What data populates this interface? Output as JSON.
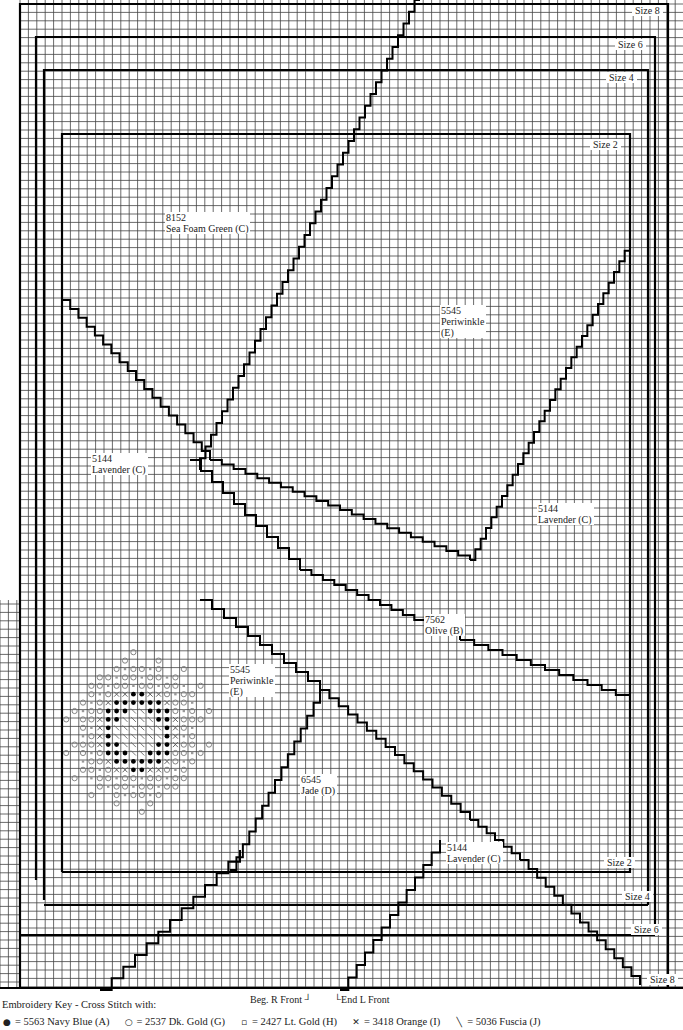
{
  "chart": {
    "type": "cross-stitch knitting chart",
    "grid": {
      "cell_px": 8.4,
      "line_color": "#222222",
      "outline_color": "#000000",
      "background": "#ffffff"
    }
  },
  "size_labels": [
    {
      "id": "size8_top",
      "text": "Size 8"
    },
    {
      "id": "size6_top",
      "text": "Size 6"
    },
    {
      "id": "size4_top",
      "text": "Size 4"
    },
    {
      "id": "size2_top",
      "text": "Size 2"
    },
    {
      "id": "size2_bottom",
      "text": "Size 2"
    },
    {
      "id": "size4_bottom",
      "text": "Size 4"
    },
    {
      "id": "size6_bottom",
      "text": "Size 6"
    },
    {
      "id": "size8_bottom",
      "text": "Size 8"
    }
  ],
  "color_regions": [
    {
      "code": "8152",
      "name": "Sea Foam Green (C)"
    },
    {
      "code": "5545",
      "name": "Periwinkle",
      "letter": "(E)"
    },
    {
      "code": "5144",
      "name": "Lavender (C)"
    },
    {
      "code": "5144",
      "name": "Lavender (C)"
    },
    {
      "code": "7562",
      "name": "Olive (B)"
    },
    {
      "code": "5545",
      "name": "Periwinkle",
      "letter": "(E)"
    },
    {
      "code": "6545",
      "name": "Jade (D)"
    },
    {
      "code": "5144",
      "name": "Lavender (C)"
    }
  ],
  "markers": {
    "beg_r_front": "Beg. R Front",
    "end_l_front": "End L Front"
  },
  "key": {
    "title": "Embroidery Key - Cross Stitch with:",
    "items": [
      {
        "symbol": "filled-dot",
        "glyph": "●",
        "text": "= 5563 Navy Blue (A)"
      },
      {
        "symbol": "open-circle",
        "glyph": "○",
        "text": "= 2537 Dk. Gold (G)"
      },
      {
        "symbol": "small-square",
        "glyph": "▫",
        "text": "= 2427 Lt. Gold (H)"
      },
      {
        "symbol": "cross",
        "glyph": "✕",
        "text": "= 3418 Orange (I)"
      },
      {
        "symbol": "backslash",
        "glyph": "╲",
        "text": "= 5036 Fuscia (J)"
      }
    ]
  }
}
